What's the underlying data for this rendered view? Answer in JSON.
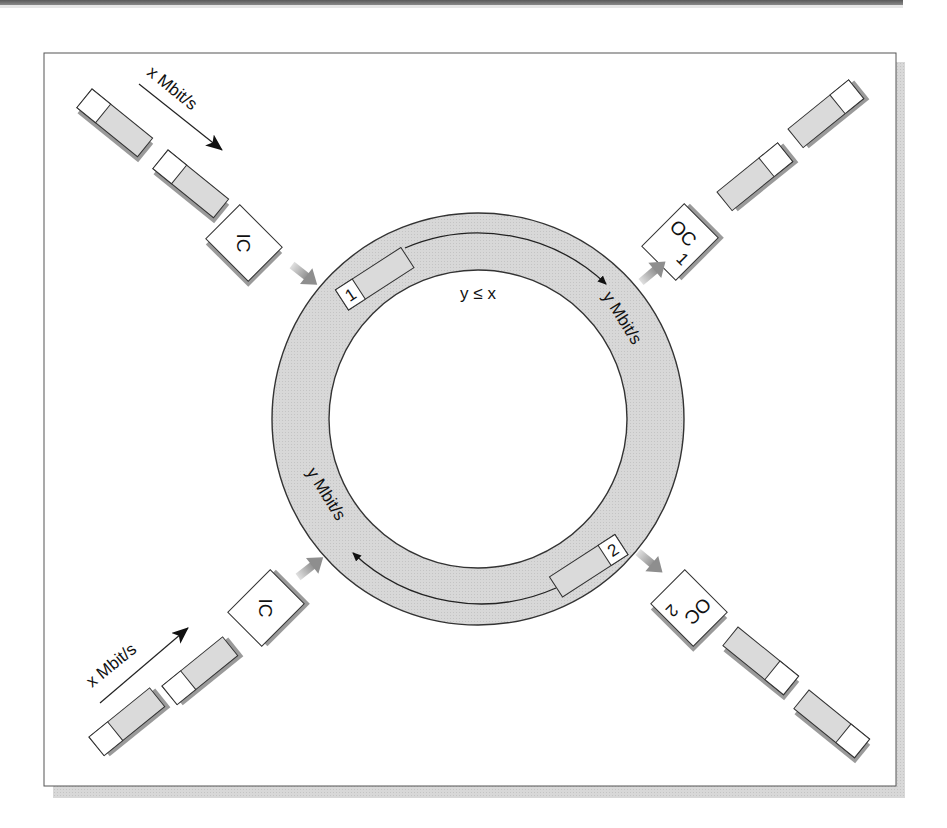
{
  "diagram": {
    "ring": {
      "label_condition": "y ≤ x",
      "top_rate_label": "y Mbit/s",
      "bottom_rate_label": "y Mbit/s",
      "slot_1_label": "1",
      "slot_2_label": "2"
    },
    "inputs": [
      {
        "position": "top-left",
        "controller_label": "IC",
        "rate_label": "x Mbit/s"
      },
      {
        "position": "bottom-left",
        "controller_label": "IC",
        "rate_label": "x Mbit/s"
      }
    ],
    "outputs": [
      {
        "position": "top-right",
        "controller_label": "OC",
        "index_label": "1"
      },
      {
        "position": "bottom-right",
        "controller_label": "OC",
        "index_label": "2"
      }
    ],
    "colors": {
      "ring_fill": "#d6d6d6",
      "packet_fill": "#d9d9d9",
      "shadow": "#9a9a9a",
      "stroke": "#333333",
      "connector_arrow": "#a8a8a8"
    }
  }
}
